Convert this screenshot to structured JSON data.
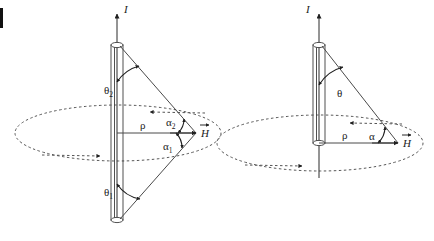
{
  "figure": {
    "background_color": "#ffffff",
    "line_color": "#4a4a4a",
    "text_color": "#1a1a1a",
    "corner_mark": " "
  },
  "panels": [
    {
      "id": "left-panel",
      "name": "finite-wire-two-angles",
      "current_label": "I",
      "rho_label": "ρ",
      "field_label": "H",
      "field_label_vector": true,
      "angles": [
        {
          "name": "theta-2",
          "symbol": "θ",
          "subscript": "2"
        },
        {
          "name": "theta-1",
          "symbol": "θ",
          "subscript": "1"
        },
        {
          "name": "alpha-2",
          "symbol": "α",
          "subscript": "2"
        },
        {
          "name": "alpha-1",
          "symbol": "α",
          "subscript": "1"
        }
      ]
    },
    {
      "id": "right-panel",
      "name": "semi-infinite-wire-one-angle",
      "current_label": "I",
      "rho_label": "ρ",
      "field_label": "H",
      "field_label_vector": true,
      "angles": [
        {
          "name": "theta",
          "symbol": "θ",
          "subscript": ""
        },
        {
          "name": "alpha",
          "symbol": "α",
          "subscript": ""
        }
      ]
    }
  ]
}
